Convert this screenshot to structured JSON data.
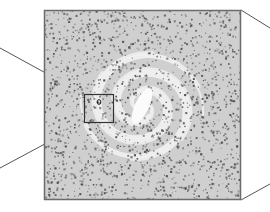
{
  "figure": {
    "main_panel": {
      "x": 44,
      "y": 10,
      "width": 197,
      "height": 190
    },
    "inset_box": {
      "x": 84,
      "y": 94,
      "width": 30,
      "height": 29
    },
    "center": {
      "x": 142,
      "y": 106
    },
    "colors": {
      "background": "#ffffff",
      "panel_fill": "#d9d9d9",
      "dots": "#555555",
      "light_bands": "#f2f2f2",
      "core": "#fafafa",
      "frame": "#6b6b6b",
      "connector": "#555555"
    }
  }
}
